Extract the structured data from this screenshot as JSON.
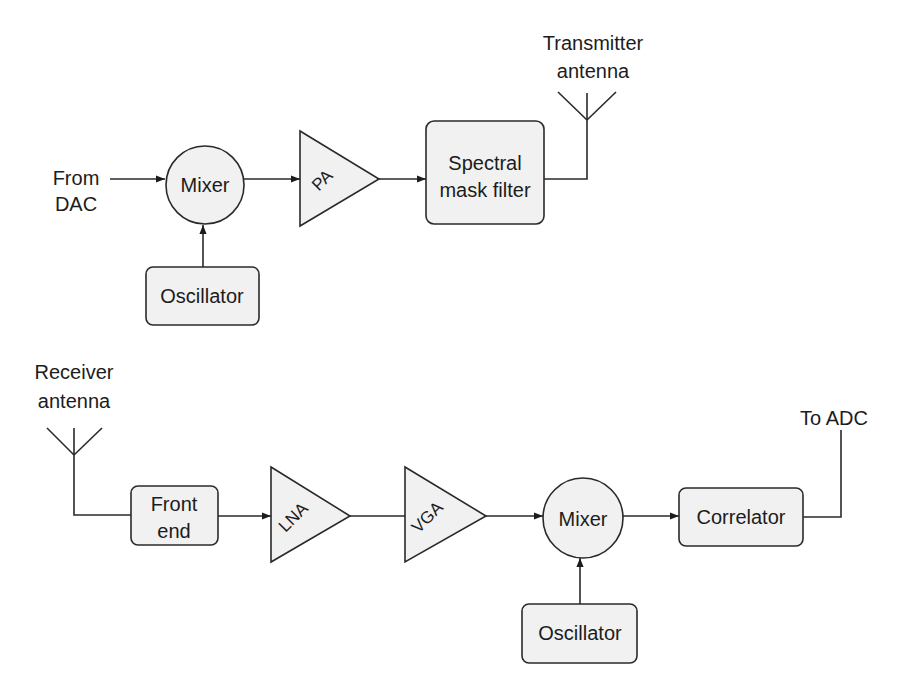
{
  "diagram": {
    "transmitter": {
      "input_label_line1": "From",
      "input_label_line2": "DAC",
      "mixer_label": "Mixer",
      "oscillator_label": "Oscillator",
      "amplifier_label": "PA",
      "filter_label_line1": "Spectral",
      "filter_label_line2": "mask filter",
      "antenna_label_line1": "Transmitter",
      "antenna_label_line2": "antenna"
    },
    "receiver": {
      "antenna_label_line1": "Receiver",
      "antenna_label_line2": "antenna",
      "front_end_label_line1": "Front",
      "front_end_label_line2": "end",
      "lna_label": "LNA",
      "vga_label": "VGA",
      "mixer_label": "Mixer",
      "oscillator_label": "Oscillator",
      "correlator_label": "Correlator",
      "output_label": "To ADC"
    },
    "connections": [
      {
        "from": "From DAC",
        "to": "Mixer (Tx)",
        "arrow": true
      },
      {
        "from": "Oscillator (Tx)",
        "to": "Mixer (Tx)",
        "arrow": true
      },
      {
        "from": "Mixer (Tx)",
        "to": "PA",
        "arrow": true
      },
      {
        "from": "PA",
        "to": "Spectral mask filter",
        "arrow": true
      },
      {
        "from": "Spectral mask filter",
        "to": "Transmitter antenna",
        "arrow": false
      },
      {
        "from": "Receiver antenna",
        "to": "Front end",
        "arrow": false
      },
      {
        "from": "Front end",
        "to": "LNA",
        "arrow": true
      },
      {
        "from": "LNA",
        "to": "VGA",
        "arrow": false
      },
      {
        "from": "VGA",
        "to": "Mixer (Rx)",
        "arrow": true
      },
      {
        "from": "Oscillator (Rx)",
        "to": "Mixer (Rx)",
        "arrow": true
      },
      {
        "from": "Mixer (Rx)",
        "to": "Correlator",
        "arrow": true
      },
      {
        "from": "Correlator",
        "to": "To ADC",
        "arrow": false
      }
    ]
  }
}
